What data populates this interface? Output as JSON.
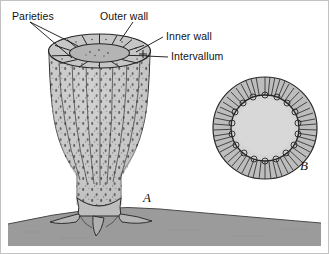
{
  "figure": {
    "background_color": "#ffffff",
    "border_color": "#b8b8b8",
    "substrate_color": "#9a9a9a",
    "body_fill": "#c9c9c9",
    "cavity_fill": "#d2d2d2",
    "ink_color": "#1a1a1a"
  },
  "labels": [
    {
      "id": "parieties",
      "text": "Parieties"
    },
    {
      "id": "outer-wall",
      "text": "Outer wall"
    },
    {
      "id": "inner-wall",
      "text": "Inner wall"
    },
    {
      "id": "intervallum",
      "text": "Intervallum"
    }
  ],
  "panels": [
    {
      "id": "a",
      "caption": "A",
      "description": "whole cup-shaped skeleton with holdfast on substrate"
    },
    {
      "id": "b",
      "caption": "B",
      "description": "transverse cross-section showing radial septa between outer and inner wall"
    }
  ]
}
